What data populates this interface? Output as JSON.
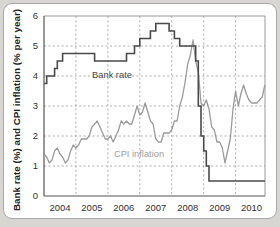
{
  "chart_data": {
    "type": "line",
    "title": "",
    "xlabel": "",
    "ylabel": "Bank rate (%) and CPI inflation (% per year)",
    "x_tick_labels": [
      "2004",
      "2005",
      "2006",
      "2007",
      "2008",
      "2009",
      "2010"
    ],
    "y_tick_labels": [
      "0",
      "1",
      "2",
      "3",
      "4",
      "5",
      "6"
    ],
    "x_range": [
      2004,
      2010.92
    ],
    "y_range": [
      0,
      6
    ],
    "grid": "dashed",
    "legend_position": "inline-annotations",
    "series": [
      {
        "name": "Bank rate",
        "style": "step",
        "color": "#4a4a4a",
        "points_note": "step change points as [decimal_year, percent]",
        "points": [
          [
            2004.0,
            3.75
          ],
          [
            2004.083,
            4.0
          ],
          [
            2004.333,
            4.25
          ],
          [
            2004.417,
            4.5
          ],
          [
            2004.583,
            4.75
          ],
          [
            2005.583,
            4.5
          ],
          [
            2006.583,
            4.75
          ],
          [
            2006.833,
            5.0
          ],
          [
            2007.0,
            5.25
          ],
          [
            2007.333,
            5.5
          ],
          [
            2007.5,
            5.75
          ],
          [
            2007.917,
            5.5
          ],
          [
            2008.083,
            5.25
          ],
          [
            2008.25,
            5.0
          ],
          [
            2008.75,
            4.5
          ],
          [
            2008.833,
            3.0
          ],
          [
            2008.917,
            2.0
          ],
          [
            2009.0,
            1.5
          ],
          [
            2009.083,
            1.0
          ],
          [
            2009.167,
            0.5
          ]
        ]
      },
      {
        "name": "CPI inflation",
        "style": "line",
        "color": "#9b9b9b",
        "start_year": 2004,
        "monthly_values": [
          1.4,
          1.3,
          1.1,
          1.2,
          1.5,
          1.6,
          1.4,
          1.3,
          1.1,
          1.2,
          1.5,
          1.7,
          1.6,
          1.7,
          1.9,
          1.9,
          1.9,
          2.0,
          2.3,
          2.4,
          2.5,
          2.3,
          2.1,
          1.9,
          1.9,
          2.0,
          1.8,
          2.0,
          2.2,
          2.5,
          2.4,
          2.5,
          2.4,
          2.4,
          2.7,
          3.0,
          2.7,
          2.8,
          3.1,
          2.8,
          2.5,
          2.4,
          1.9,
          1.8,
          1.8,
          2.1,
          2.1,
          2.1,
          2.2,
          2.5,
          2.5,
          3.0,
          3.3,
          3.8,
          4.4,
          4.7,
          5.2,
          4.5,
          4.1,
          3.1,
          3.0,
          3.2,
          2.9,
          2.3,
          2.2,
          1.8,
          1.8,
          1.6,
          1.1,
          1.5,
          1.9,
          2.9,
          3.5,
          3.0,
          3.4,
          3.7,
          3.4,
          3.2,
          3.1,
          3.1,
          3.1,
          3.2,
          3.3,
          3.7
        ]
      }
    ]
  },
  "colors": {
    "page_bg": "#d8d6d3",
    "card_bg": "#ffffff",
    "card_border": "#a9a9a9",
    "grid": "#999999",
    "frame_light": "#999999",
    "axis_dark": "#555555",
    "tick_text": "#333333",
    "bank_rate_line": "#4a4a4a",
    "cpi_line": "#9b9b9b",
    "cpi_label_text": "#a0a0a0"
  }
}
